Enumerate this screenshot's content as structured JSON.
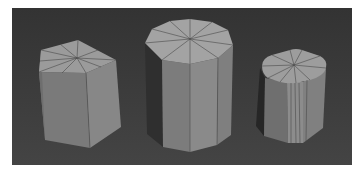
{
  "scene": {
    "description": "3D viewport render of three grey prism/cylinder primitives with wireframe edges",
    "background_color": "#3a3a3a",
    "frame_color": "#ffffff",
    "objects": [
      {
        "name": "pentagonal-prism",
        "sides": 5,
        "top_color": "#9a9a9a",
        "side_color": "#7e7e7e",
        "dark_color": "#5a5a5a"
      },
      {
        "name": "decagonal-prism",
        "sides": 10,
        "top_color": "#a2a2a2",
        "side_color": "#858585",
        "dark_color": "#2e2e2e"
      },
      {
        "name": "rounded-cylinder",
        "sides": 16,
        "top_color": "#9c9c9c",
        "side_color": "#808080",
        "dark_color": "#2a2a2a"
      }
    ]
  }
}
